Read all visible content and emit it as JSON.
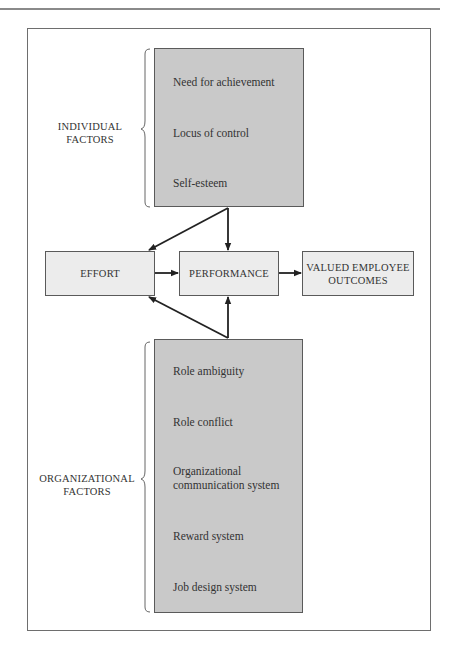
{
  "diagram": {
    "individual_factors": {
      "label_line1": "INDIVIDUAL",
      "label_line2": "FACTORS",
      "items": [
        "Need for achievement",
        "Locus of control",
        "Self-esteem"
      ]
    },
    "organizational_factors": {
      "label_line1": "ORGANIZATIONAL",
      "label_line2": "FACTORS",
      "items": [
        "Role ambiguity",
        "Role conflict",
        "Organizational",
        "communication system",
        "Reward system",
        "Job design system"
      ]
    },
    "nodes": {
      "effort": "EFFORT",
      "performance": "PERFORMANCE",
      "outcomes_line1": "VALUED EMPLOYEE",
      "outcomes_line2": "OUTCOMES"
    },
    "edges": [
      {
        "from": "individual_factors",
        "to": "effort"
      },
      {
        "from": "individual_factors",
        "to": "performance"
      },
      {
        "from": "effort",
        "to": "performance"
      },
      {
        "from": "performance",
        "to": "valued_employee_outcomes"
      },
      {
        "from": "organizational_factors",
        "to": "effort"
      },
      {
        "from": "organizational_factors",
        "to": "performance"
      }
    ],
    "colors": {
      "factor_box_fill": "#c9c9c9",
      "node_fill": "#ececec",
      "stroke": "#5a5a5a",
      "arrow": "#222222"
    }
  }
}
